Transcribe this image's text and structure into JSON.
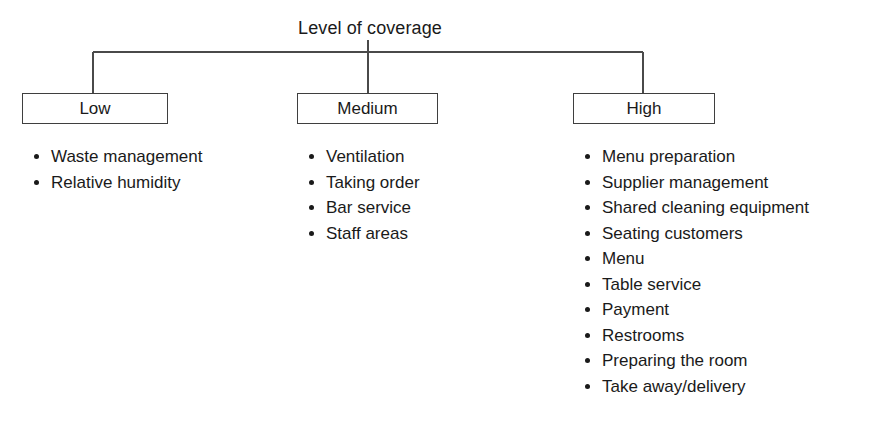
{
  "diagram": {
    "title": "Level of coverage",
    "columns": [
      {
        "id": "low",
        "label": "Low",
        "items": [
          "Waste management",
          "Relative humidity"
        ]
      },
      {
        "id": "medium",
        "label": "Medium",
        "items": [
          "Ventilation",
          "Taking order",
          "Bar service",
          "Staff areas"
        ]
      },
      {
        "id": "high",
        "label": "High",
        "items": [
          "Menu preparation",
          "Supplier management",
          "Shared cleaning equipment",
          "Seating customers",
          "Menu",
          "Table service",
          "Payment",
          "Restrooms",
          "Preparing the room",
          "Take away/delivery"
        ]
      }
    ],
    "colors": {
      "background": "#ffffff",
      "text": "#1a1a1a",
      "box_border": "#3f3f3f",
      "connector": "#4a4a4a"
    }
  }
}
